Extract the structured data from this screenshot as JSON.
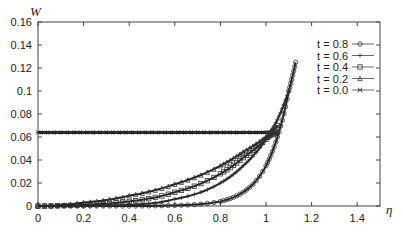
{
  "chart_data": {
    "type": "line",
    "title": "",
    "xlabel": "η",
    "ylabel": "W",
    "xlim": [
      0,
      1.5
    ],
    "ylim": [
      0,
      0.16
    ],
    "xticks": [
      "0",
      "0.2",
      "0.4",
      "0.6",
      "0.8",
      "1",
      "1.2",
      "1.4"
    ],
    "yticks": [
      "0",
      "0.02",
      "0.04",
      "0.06",
      "0.08",
      "0.1",
      "0.12",
      "0.14",
      "0.16"
    ],
    "grid": false,
    "legend_position": "upper right",
    "series": [
      {
        "name": "t = 0.8",
        "marker": "circle",
        "x": [
          0,
          0.2,
          0.4,
          0.6,
          0.8,
          0.9,
          1.0,
          1.05,
          1.1,
          1.13
        ],
        "y": [
          0,
          0,
          0,
          0.0005,
          0.004,
          0.012,
          0.035,
          0.06,
          0.1,
          0.125
        ]
      },
      {
        "name": "t = 0.6",
        "marker": "plus",
        "x": [
          0,
          0.2,
          0.4,
          0.6,
          0.8,
          0.9,
          1.0,
          1.05,
          1.1
        ],
        "y": [
          0,
          0,
          0.001,
          0.006,
          0.02,
          0.035,
          0.058,
          0.075,
          0.1
        ]
      },
      {
        "name": "t = 0.4",
        "marker": "square",
        "x": [
          0,
          0.2,
          0.4,
          0.6,
          0.8,
          0.9,
          1.0,
          1.05
        ],
        "y": [
          0,
          0.001,
          0.004,
          0.012,
          0.028,
          0.042,
          0.058,
          0.07
        ]
      },
      {
        "name": "t = 0.2",
        "marker": "triangle",
        "x": [
          0,
          0.2,
          0.4,
          0.6,
          0.8,
          0.9,
          1.0,
          1.05
        ],
        "y": [
          0,
          0.003,
          0.009,
          0.019,
          0.035,
          0.047,
          0.06,
          0.064
        ]
      },
      {
        "name": "t = 0.0",
        "marker": "star",
        "x": [
          0,
          0.2,
          0.4,
          0.6,
          0.8,
          1.0,
          1.05
        ],
        "y": [
          0.064,
          0.064,
          0.064,
          0.064,
          0.064,
          0.064,
          0.064
        ]
      }
    ]
  }
}
